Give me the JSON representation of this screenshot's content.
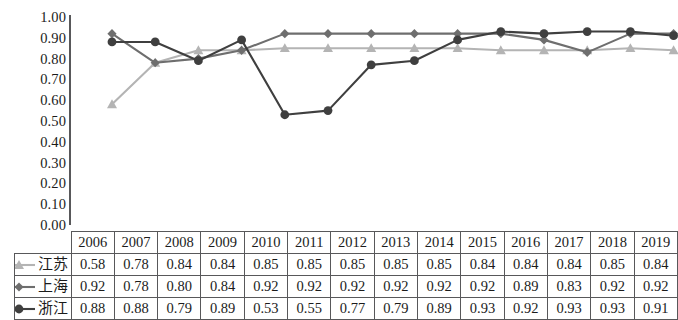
{
  "chart_data": {
    "type": "line",
    "title": "",
    "subtitle": "",
    "xlabel": "",
    "ylabel": "",
    "ylim": [
      0.0,
      1.0
    ],
    "grid": false,
    "legend_position": "table-left",
    "categories": [
      "2006",
      "2007",
      "2008",
      "2009",
      "2010",
      "2011",
      "2012",
      "2013",
      "2014",
      "2015",
      "2016",
      "2017",
      "2018",
      "2019"
    ],
    "y_ticks": [
      "0.00",
      "0.10",
      "0.20",
      "0.30",
      "0.40",
      "0.50",
      "0.60",
      "0.70",
      "0.80",
      "0.90",
      "1.00"
    ],
    "y_tick_values": [
      0.0,
      0.1,
      0.2,
      0.3,
      0.4,
      0.5,
      0.6,
      0.7,
      0.8,
      0.9,
      1.0
    ],
    "series": [
      {
        "name": "江苏",
        "marker": "triangle",
        "color": "#b4b4b4",
        "values": [
          0.58,
          0.78,
          0.84,
          0.84,
          0.85,
          0.85,
          0.85,
          0.85,
          0.85,
          0.84,
          0.84,
          0.84,
          0.85,
          0.84
        ],
        "labels": [
          "0.58",
          "0.78",
          "0.84",
          "0.84",
          "0.85",
          "0.85",
          "0.85",
          "0.85",
          "0.85",
          "0.84",
          "0.84",
          "0.84",
          "0.85",
          "0.84"
        ]
      },
      {
        "name": "上海",
        "marker": "diamond",
        "color": "#6e6e6e",
        "values": [
          0.92,
          0.78,
          0.8,
          0.84,
          0.92,
          0.92,
          0.92,
          0.92,
          0.92,
          0.92,
          0.89,
          0.83,
          0.92,
          0.92
        ],
        "labels": [
          "0.92",
          "0.78",
          "0.80",
          "0.84",
          "0.92",
          "0.92",
          "0.92",
          "0.92",
          "0.92",
          "0.92",
          "0.89",
          "0.83",
          "0.92",
          "0.92"
        ]
      },
      {
        "name": "浙江",
        "marker": "circle",
        "color": "#3f3f3f",
        "values": [
          0.88,
          0.88,
          0.79,
          0.89,
          0.53,
          0.55,
          0.77,
          0.79,
          0.89,
          0.93,
          0.92,
          0.93,
          0.93,
          0.91
        ],
        "labels": [
          "0.88",
          "0.88",
          "0.79",
          "0.89",
          "0.53",
          "0.55",
          "0.77",
          "0.79",
          "0.89",
          "0.93",
          "0.92",
          "0.93",
          "0.93",
          "0.91"
        ]
      }
    ]
  },
  "table": {
    "corner_label": "",
    "header": [
      "2006",
      "2007",
      "2008",
      "2009",
      "2010",
      "2011",
      "2012",
      "2013",
      "2014",
      "2015",
      "2016",
      "2017",
      "2018",
      "2019"
    ],
    "rows": [
      {
        "label": "江苏",
        "values": [
          "0.58",
          "0.78",
          "0.84",
          "0.84",
          "0.85",
          "0.85",
          "0.85",
          "0.85",
          "0.85",
          "0.84",
          "0.84",
          "0.84",
          "0.85",
          "0.84"
        ]
      },
      {
        "label": "上海",
        "values": [
          "0.92",
          "0.78",
          "0.80",
          "0.84",
          "0.92",
          "0.92",
          "0.92",
          "0.92",
          "0.92",
          "0.92",
          "0.89",
          "0.83",
          "0.92",
          "0.92"
        ]
      },
      {
        "label": "浙江",
        "values": [
          "0.88",
          "0.88",
          "0.79",
          "0.89",
          "0.53",
          "0.55",
          "0.77",
          "0.79",
          "0.89",
          "0.93",
          "0.92",
          "0.93",
          "0.93",
          "0.91"
        ]
      }
    ]
  },
  "colors": {
    "jiangsu": "#b4b4b4",
    "shanghai": "#6e6e6e",
    "zhejiang": "#3f3f3f",
    "axis": "#58585a",
    "text": "#1b1b1b",
    "background": "#ffffff"
  }
}
